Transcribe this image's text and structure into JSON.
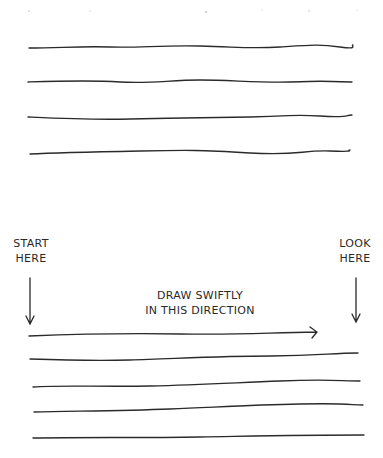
{
  "labels": {
    "start": [
      "START",
      "HERE"
    ],
    "look": [
      "LOOK",
      "HERE"
    ],
    "instruction": [
      "DRAW SWIFTLY",
      "IN THIS DIRECTION"
    ]
  },
  "colors": {
    "ink": "#2a2a2a",
    "background": "#ffffff"
  },
  "example_lines": {
    "count": 4,
    "style": "wobbly-slow"
  },
  "practice_lines": {
    "count": 4,
    "style": "smooth-swift"
  },
  "direction_arrow": {
    "direction": "left-to-right"
  }
}
